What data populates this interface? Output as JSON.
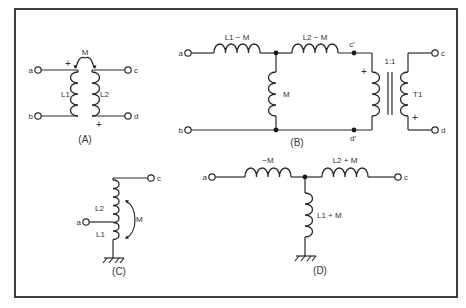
{
  "figure": {
    "panel_A": {
      "caption": "(A)",
      "terminals": {
        "a": "a",
        "b": "b",
        "c": "c",
        "d": "d"
      },
      "coil_left": "L1",
      "coil_right": "L2",
      "mutual": "M",
      "polarity_top": "+",
      "polarity_bottom": "+"
    },
    "panel_B": {
      "caption": "(B)",
      "terminals": {
        "a": "a",
        "b": "b",
        "c": "c",
        "d": "d"
      },
      "series_1": "L1 − M",
      "series_2": "L2 − M",
      "shunt": "M",
      "node_top": "c'",
      "node_bottom": "d'",
      "ratio": "1:1",
      "transformer": "T1",
      "polarity_primary": "+",
      "polarity_secondary": "+"
    },
    "panel_C": {
      "caption": "(C)",
      "terminals": {
        "a": "a",
        "c": "c"
      },
      "upper_coil": "L2",
      "lower_coil": "L1",
      "mutual": "M"
    },
    "panel_D": {
      "caption": "(D)",
      "terminals": {
        "a": "a",
        "c": "c"
      },
      "series_1": "−M",
      "series_2": "L2 + M",
      "shunt": "L1 + M"
    }
  }
}
